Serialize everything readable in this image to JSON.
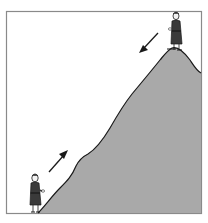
{
  "illustration": {
    "description": "Monk walking up and down a mountain",
    "colors": {
      "background": "#ffffff",
      "frame": "#8a8a8a",
      "mountain_fill": "#a9a9a9",
      "outline": "#1a1a1a",
      "robe": "#3a3a3a",
      "skin": "#f2f2f2"
    },
    "figures": [
      {
        "name": "monk-at-bottom",
        "position": "base of mountain",
        "direction": "ascending"
      },
      {
        "name": "monk-at-top",
        "position": "summit",
        "direction": "descending"
      }
    ],
    "arrows": [
      {
        "name": "up-arrow",
        "direction": "up-right"
      },
      {
        "name": "down-arrow",
        "direction": "down-left"
      }
    ]
  }
}
